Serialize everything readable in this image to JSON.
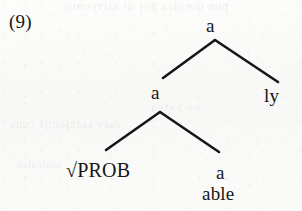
{
  "figure": {
    "example_number": "(9)",
    "type": "syntactic-tree"
  },
  "tree": {
    "root": {
      "label": "a",
      "children": [
        {
          "label": "a",
          "children": [
            {
              "label": "√PROB"
            },
            {
              "label": "a",
              "terminal": "able"
            }
          ]
        },
        {
          "label": "ly"
        }
      ]
    },
    "nodes": {
      "root_a": "a",
      "mid_a": "a",
      "ly": "ly",
      "root_prob": "√PROB",
      "a_able": "a",
      "able": "able"
    }
  },
  "ghost_text": {
    "line1": "pue uorjdsa yor ui sarryonijs",
    "line2": "aaey saanjonijs yous",
    "line3": "uo  paseq",
    "line4": "uoijealap"
  },
  "colors": {
    "ink": "#16161a",
    "paper": "#fbfbfa",
    "bleed_through": "rgba(40,40,55,0.085)"
  }
}
